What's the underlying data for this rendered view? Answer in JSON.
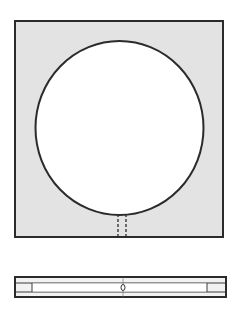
{
  "diagram": {
    "colors": {
      "background": "#ffffff",
      "plate_fill": "#e3e3e3",
      "outline": "#2b2b2b",
      "hole_fill": "#ffffff"
    },
    "top_view": {
      "plate": {
        "x": 15,
        "y": 21,
        "width": 208,
        "height": 216
      },
      "hole": {
        "cx": 119.5,
        "cy": 128,
        "rx": 84,
        "ry": 87
      },
      "slot": {
        "x1": 118,
        "x2": 126,
        "y_top": 214,
        "y_bottom": 237,
        "style": "dashed"
      }
    },
    "side_view": {
      "outer": {
        "x": 15,
        "y": 277,
        "width": 211,
        "height": 20
      },
      "inner_lines_y": [
        283,
        292
      ],
      "ticks_x": [
        32,
        207
      ],
      "center_mark": {
        "cx": 123,
        "cy": 287.5,
        "rx": 2,
        "ry": 3
      }
    }
  }
}
